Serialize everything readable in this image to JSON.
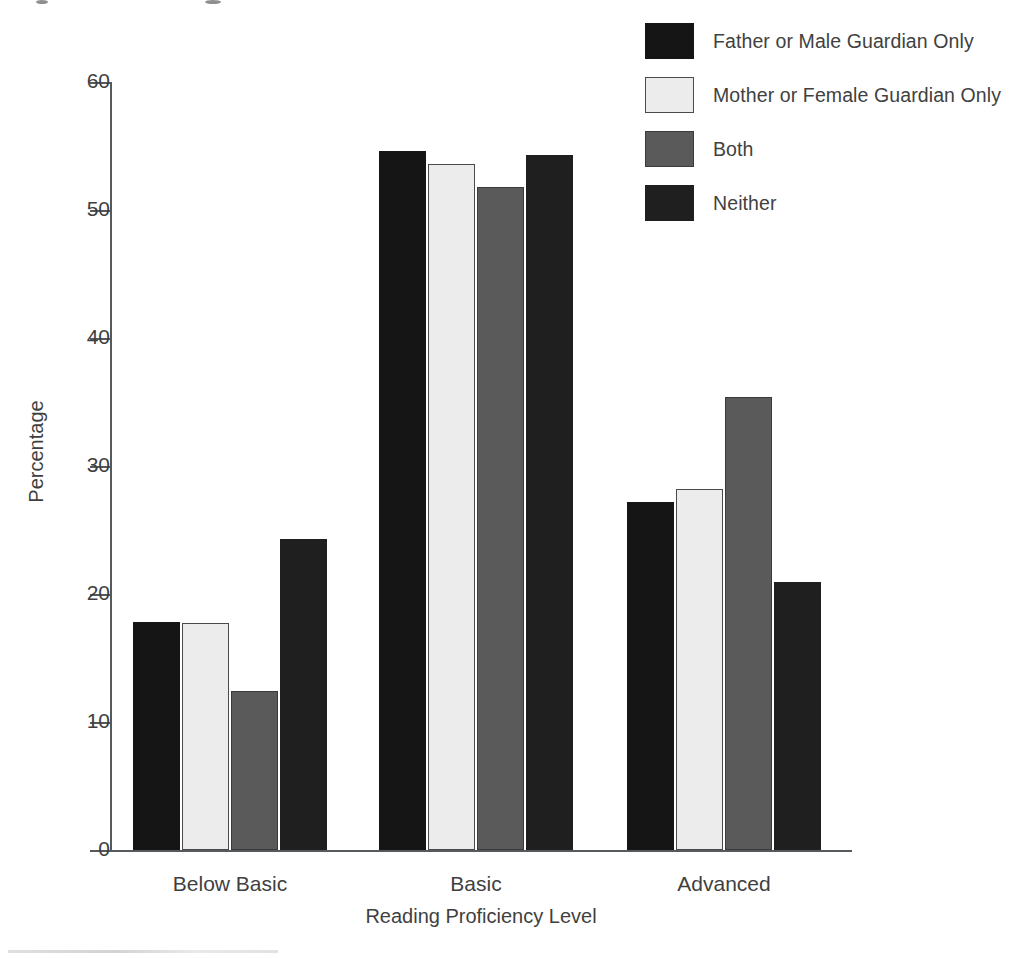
{
  "chart_data": {
    "type": "bar",
    "title": "",
    "subtitle": "",
    "xlabel": "Reading Proficiency Level",
    "ylabel": "Percentage",
    "categories": [
      "Below Basic",
      "Basic",
      "Advanced"
    ],
    "series": [
      {
        "name": "Father or Male Guardian Only",
        "color": "#151515",
        "border": "#151515",
        "values": [
          17.8,
          54.6,
          27.2
        ]
      },
      {
        "name": "Mother or Female Guardian Only",
        "color": "#ececec",
        "border": "#4a4a4a",
        "values": [
          17.7,
          53.6,
          28.2
        ]
      },
      {
        "name": "Both",
        "color": "#5a5a5a",
        "border": "#3a3a3a",
        "values": [
          12.4,
          51.8,
          35.4
        ]
      },
      {
        "name": "Neither",
        "color": "#1f1f1f",
        "border": "#1f1f1f",
        "values": [
          24.3,
          54.3,
          20.9
        ]
      }
    ],
    "ylim": [
      0,
      60
    ],
    "yticks": [
      0,
      10,
      20,
      30,
      40,
      50,
      60
    ],
    "ytick_labels": [
      "0",
      "10",
      "20",
      "30",
      "40",
      "50",
      "60"
    ],
    "grid": false,
    "legend_position": "top-right",
    "axis_color": "#555a5e"
  },
  "axes": {
    "y_label": "Percentage",
    "x_label": "Reading Proficiency Level"
  },
  "legend": {
    "items": [
      {
        "label": "Father or Male Guardian Only"
      },
      {
        "label": "Mother or Female Guardian Only"
      },
      {
        "label": "Both"
      },
      {
        "label": "Neither"
      }
    ]
  }
}
